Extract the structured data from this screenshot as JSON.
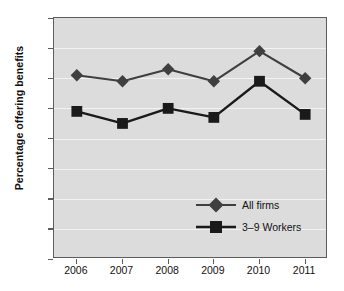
{
  "chart_data": {
    "type": "line",
    "title": "",
    "xlabel": "",
    "ylabel": "Percentage offering benefits",
    "categories": [
      "2006",
      "2007",
      "2008",
      "2009",
      "2010",
      "2011"
    ],
    "ylim": [
      0,
      80
    ],
    "ytick_values": [
      0,
      10,
      20,
      30,
      40,
      50,
      60,
      70,
      80
    ],
    "ytick_labels": [
      "0",
      "10",
      "20",
      "30",
      "40",
      "50",
      "60",
      "70",
      "80"
    ],
    "grid": true,
    "legend_position": "center-right",
    "series": [
      {
        "name": "All firms",
        "marker": "diamond",
        "color": "#3f3f3f",
        "values": [
          61,
          59,
          63,
          59,
          69,
          60
        ]
      },
      {
        "name": "3–9 Workers",
        "marker": "square",
        "color": "#1a1a1a",
        "values": [
          49,
          45,
          50,
          47,
          59,
          48
        ]
      }
    ]
  },
  "colors": {
    "plot_background": "#dcdcdc",
    "gridline": "#f2f2f2",
    "frame": "#5c5c5c",
    "text": "#111111",
    "all_firms": "#3f3f3f",
    "workers_3_9": "#1a1a1a"
  }
}
